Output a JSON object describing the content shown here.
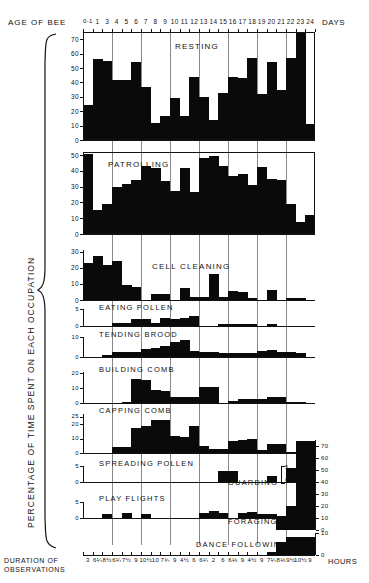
{
  "figure": {
    "top_axis_label": "AGE OF BEE",
    "top_axis_unit": "DAYS",
    "y_axis_label": "PERCENTAGE OF TIME SPENT ON EACH OCCUPATION",
    "bottom_axis_label_line1": "DURATION OF",
    "bottom_axis_label_line2": "OBSERVATIONS",
    "bottom_axis_unit": "HOURS",
    "day_ticks": [
      "0-1",
      "1",
      "3",
      "4",
      "5",
      "6",
      "7",
      "8",
      "9",
      "10",
      "11",
      "12",
      "13",
      "14",
      "15",
      "16",
      "17",
      "18",
      "19",
      "20",
      "21",
      "22",
      "23",
      "24"
    ],
    "duration_ticks": [
      "3",
      "6¼",
      "8½",
      "6¼",
      "7½",
      "9",
      "10½",
      "10",
      "7¾",
      "9",
      "4½",
      "6",
      "6¼",
      "2",
      "6",
      "6⅛",
      "9",
      "4½",
      "9",
      "7¼",
      "8⅛",
      "9½",
      "10½",
      "9"
    ]
  },
  "chart_data": [
    {
      "type": "bar",
      "title": "RESTING",
      "xlabel": "AGE OF BEE (DAYS)",
      "ylabel": "PERCENTAGE OF TIME SPENT ON EACH OCCUPATION",
      "ylim": [
        0,
        75
      ],
      "yticks": [
        0,
        10,
        20,
        30,
        40,
        50,
        60,
        70
      ],
      "grid": true,
      "categories": [
        "0-1",
        "1",
        "3",
        "4",
        "5",
        "6",
        "7",
        "8",
        "9",
        "10",
        "11",
        "12",
        "13",
        "14",
        "15",
        "16",
        "17",
        "18",
        "19",
        "20",
        "21",
        "22",
        "23",
        "24"
      ],
      "values": [
        24,
        56,
        55,
        42,
        42,
        54,
        37,
        12,
        17,
        29.5,
        17,
        43.5,
        30,
        14,
        32.5,
        44,
        43,
        57,
        32,
        54.5,
        34.5,
        57,
        75,
        11
      ]
    },
    {
      "type": "bar",
      "title": "PATROLLING",
      "ylim": [
        0,
        52
      ],
      "yticks": [
        0,
        10,
        20,
        30,
        40,
        50
      ],
      "grid": true,
      "categories": [
        "0-1",
        "1",
        "3",
        "4",
        "5",
        "6",
        "7",
        "8",
        "9",
        "10",
        "11",
        "12",
        "13",
        "14",
        "15",
        "16",
        "17",
        "18",
        "19",
        "20",
        "21",
        "22",
        "23",
        "24"
      ],
      "values": [
        51,
        15.5,
        19,
        30,
        32,
        34,
        43,
        42,
        33.5,
        27,
        42,
        26.5,
        48,
        49.5,
        43,
        36.5,
        38,
        31,
        42.5,
        35,
        34.5,
        19,
        7.5,
        12
      ]
    },
    {
      "type": "bar",
      "title": "CELL CLEANING",
      "ylim": [
        0,
        31
      ],
      "yticks": [
        0,
        10,
        20,
        30
      ],
      "grid": true,
      "categories": [
        "0-1",
        "1",
        "3",
        "4",
        "5",
        "6",
        "7",
        "8",
        "9",
        "10",
        "11",
        "12",
        "13",
        "14",
        "15",
        "16",
        "17",
        "18",
        "19",
        "20",
        "21",
        "22",
        "23",
        "24"
      ],
      "values": [
        23,
        27,
        22,
        24,
        9,
        8,
        0,
        4,
        4,
        0,
        7.5,
        2,
        2,
        16,
        2,
        5.5,
        5,
        1,
        0,
        6.5,
        0,
        1,
        1,
        0
      ]
    },
    {
      "type": "bar",
      "title": "EATING POLLEN",
      "ylim": [
        0,
        5
      ],
      "yticks": [
        0,
        5
      ],
      "grid": true,
      "categories": [
        "0-1",
        "1",
        "3",
        "4",
        "5",
        "6",
        "7",
        "8",
        "9",
        "10",
        "11",
        "12",
        "13",
        "14",
        "15",
        "16",
        "17",
        "18",
        "19",
        "20",
        "21",
        "22",
        "23",
        "24"
      ],
      "values": [
        0,
        0,
        0,
        1,
        1,
        2,
        2,
        1,
        2.5,
        2,
        2.5,
        3,
        0,
        0,
        0.6,
        0.6,
        0.6,
        0.6,
        0,
        0.5,
        0,
        0,
        0,
        0
      ]
    },
    {
      "type": "bar",
      "title": "TENDING BROOD",
      "ylim": [
        0,
        10
      ],
      "yticks": [
        0,
        10
      ],
      "grid": true,
      "categories": [
        "0-1",
        "1",
        "3",
        "4",
        "5",
        "6",
        "7",
        "8",
        "9",
        "10",
        "11",
        "12",
        "13",
        "14",
        "15",
        "16",
        "17",
        "18",
        "19",
        "20",
        "21",
        "22",
        "23",
        "24"
      ],
      "values": [
        0,
        0,
        1,
        2.5,
        2.5,
        2.5,
        4,
        4.5,
        5.5,
        7.5,
        8.5,
        3,
        2.5,
        2.5,
        2,
        2,
        2,
        2,
        3,
        3.5,
        2.5,
        2.5,
        2,
        0
      ]
    },
    {
      "type": "bar",
      "title": "BUILDING COMB",
      "ylim": [
        0,
        21
      ],
      "yticks": [
        0,
        10,
        20
      ],
      "grid": true,
      "categories": [
        "0-1",
        "1",
        "3",
        "4",
        "5",
        "6",
        "7",
        "8",
        "9",
        "10",
        "11",
        "12",
        "13",
        "14",
        "15",
        "16",
        "17",
        "18",
        "19",
        "20",
        "21",
        "22",
        "23",
        "24"
      ],
      "values": [
        0,
        0,
        0,
        0,
        1,
        16,
        15.5,
        9,
        8,
        4,
        4,
        4,
        11,
        11,
        0,
        1.5,
        2.5,
        2.5,
        2.5,
        4,
        4,
        1,
        1,
        0
      ]
    },
    {
      "type": "bar",
      "title": "CAPPING COMB",
      "ylim": [
        0,
        27
      ],
      "yticks": [
        0,
        10,
        20,
        25
      ],
      "grid": true,
      "categories": [
        "0-1",
        "1",
        "3",
        "4",
        "5",
        "6",
        "7",
        "8",
        "9",
        "10",
        "11",
        "12",
        "13",
        "14",
        "15",
        "16",
        "17",
        "18",
        "19",
        "20",
        "21",
        "22",
        "23",
        "24"
      ],
      "values": [
        0,
        0,
        0,
        4,
        4.5,
        17,
        19,
        23,
        23,
        12,
        11,
        19,
        5,
        3,
        3,
        8,
        9,
        10,
        2,
        6,
        6,
        1,
        0,
        0
      ]
    },
    {
      "type": "bar",
      "title": "SPREADING POLLEN",
      "ylim": [
        0,
        5
      ],
      "yticks": [
        0,
        5
      ],
      "grid": true,
      "categories": [
        "0-1",
        "1",
        "3",
        "4",
        "5",
        "6",
        "7",
        "8",
        "9",
        "10",
        "11",
        "12",
        "13",
        "14",
        "15",
        "16",
        "17",
        "18",
        "19",
        "20",
        "21",
        "22",
        "23",
        "24"
      ],
      "values": [
        0,
        0,
        0,
        0,
        0,
        0,
        0,
        0,
        0,
        0,
        0,
        0,
        0,
        0,
        3.5,
        3.5,
        0,
        0,
        0,
        2,
        0,
        3.5,
        3.5,
        0
      ]
    },
    {
      "type": "bar",
      "title": "GUARDING",
      "ylim": [
        0,
        5
      ],
      "yticks": [
        0,
        5
      ],
      "grid": true,
      "categories": [
        "0-1",
        "1",
        "3",
        "4",
        "5",
        "6",
        "7",
        "8",
        "9",
        "10",
        "11",
        "12",
        "13",
        "14",
        "15",
        "16",
        "17",
        "18",
        "19",
        "20",
        "21",
        "22",
        "23",
        "24"
      ],
      "values": [
        0,
        0,
        0,
        0,
        0,
        0,
        0,
        0,
        0,
        0,
        0,
        0,
        0,
        0,
        0,
        0,
        0,
        0,
        0,
        0,
        0,
        4.5,
        4.5,
        0
      ]
    },
    {
      "type": "bar",
      "title": "PLAY FLIGHTS",
      "ylim": [
        0,
        5
      ],
      "yticks": [
        0,
        5
      ],
      "grid": true,
      "categories": [
        "0-1",
        "1",
        "3",
        "4",
        "5",
        "6",
        "7",
        "8",
        "9",
        "10",
        "11",
        "12",
        "13",
        "14",
        "15",
        "16",
        "17",
        "18",
        "19",
        "20",
        "21",
        "22",
        "23",
        "24"
      ],
      "values": [
        0,
        0,
        1.2,
        0,
        1.6,
        0,
        1.2,
        0,
        0,
        0,
        0,
        0,
        1.5,
        2.2,
        1.5,
        0,
        1.5,
        1.8,
        1.2,
        1.2,
        0,
        0,
        0,
        0
      ]
    },
    {
      "type": "bar",
      "title": "FORAGING",
      "ylim": [
        0,
        75
      ],
      "yticks": [
        0,
        10,
        20,
        30,
        40,
        50,
        60,
        70
      ],
      "grid": true,
      "axis_side": "right",
      "categories": [
        "0-1",
        "1",
        "3",
        "4",
        "5",
        "6",
        "7",
        "8",
        "9",
        "10",
        "11",
        "12",
        "13",
        "14",
        "15",
        "16",
        "17",
        "18",
        "19",
        "20",
        "21",
        "22",
        "23",
        "24"
      ],
      "values": [
        0,
        0,
        0,
        0,
        0,
        0,
        0,
        0,
        0,
        0,
        0,
        0,
        0,
        0,
        0,
        0,
        0,
        0,
        0,
        0,
        12,
        20,
        74,
        74
      ]
    },
    {
      "type": "bar",
      "title": "DANCE FOLLOWING",
      "ylim": [
        0,
        10
      ],
      "yticks": [
        0,
        10
      ],
      "grid": true,
      "axis_side": "right",
      "categories": [
        "0-1",
        "1",
        "3",
        "4",
        "5",
        "6",
        "7",
        "8",
        "9",
        "10",
        "11",
        "12",
        "13",
        "14",
        "15",
        "16",
        "17",
        "18",
        "19",
        "20",
        "21",
        "22",
        "23",
        "24"
      ],
      "values": [
        0,
        0,
        0,
        0,
        0,
        0,
        0,
        0,
        0,
        0,
        0,
        0,
        0,
        0,
        0,
        0,
        0,
        0,
        0,
        1.5,
        6,
        8,
        8,
        8
      ]
    }
  ]
}
